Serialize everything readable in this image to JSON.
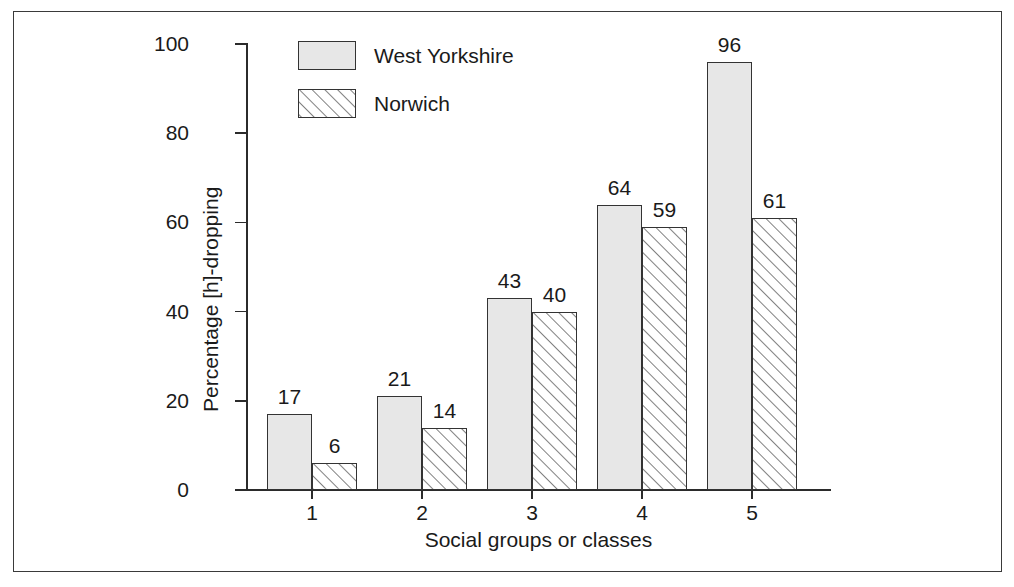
{
  "chart_data": {
    "type": "bar",
    "title": "",
    "subtitle": "",
    "xlabel": "Social groups or classes",
    "ylabel": "Percentage [h]-dropping",
    "categories": [
      "1",
      "2",
      "3",
      "4",
      "5"
    ],
    "series": [
      {
        "name": "West Yorkshire",
        "values": [
          17,
          21,
          43,
          64,
          96
        ],
        "fill": "solid",
        "color": "#e7e7e7",
        "edge_color": "#333333"
      },
      {
        "name": "Norwich",
        "values": [
          6,
          14,
          40,
          59,
          61
        ],
        "fill": "diagonal-hatch",
        "color": "#ffffff",
        "edge_color": "#333333"
      }
    ],
    "ylim": [
      0,
      100
    ],
    "yticks": [
      0,
      20,
      40,
      60,
      80,
      100
    ],
    "ytick_labels": [
      "0",
      "20",
      "40",
      "60",
      "80",
      "100"
    ],
    "grid": false,
    "legend_position": "top-left-inside",
    "bar_labels_shown": true,
    "axis_color": "#2b2b2b",
    "text_color": "#1a1a1a",
    "frame_color": "#3a3a3a",
    "background": "#ffffff"
  },
  "legend": {
    "entries": [
      {
        "label": "West Yorkshire",
        "swatch": "solid-gray-swatch"
      },
      {
        "label": "Norwich",
        "swatch": "diagonal-hatch-swatch"
      }
    ]
  },
  "axes": {
    "y_label": "Percentage [h]-dropping",
    "x_label": "Social groups or classes",
    "y_tick_labels": [
      "100",
      "80",
      "60",
      "40",
      "20",
      "0"
    ],
    "x_tick_labels": [
      "1",
      "2",
      "3",
      "4",
      "5"
    ]
  },
  "bar_value_labels": {
    "group_1": [
      "17",
      "6"
    ],
    "group_2": [
      "21",
      "14"
    ],
    "group_3": [
      "43",
      "40"
    ],
    "group_4": [
      "64",
      "59"
    ],
    "group_5": [
      "96",
      "61"
    ]
  }
}
